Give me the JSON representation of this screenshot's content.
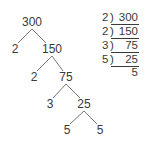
{
  "factor_tree": {
    "nodes": [
      {
        "id": "n300",
        "label": "300",
        "x": 32,
        "y": 22
      },
      {
        "id": "n2a",
        "label": "2",
        "x": 15,
        "y": 49
      },
      {
        "id": "n150",
        "label": "150",
        "x": 52,
        "y": 49
      },
      {
        "id": "n2b",
        "label": "2",
        "x": 34,
        "y": 77
      },
      {
        "id": "n75",
        "label": "75",
        "x": 66,
        "y": 77
      },
      {
        "id": "n3",
        "label": "3",
        "x": 50,
        "y": 104
      },
      {
        "id": "n25",
        "label": "25",
        "x": 84,
        "y": 104
      },
      {
        "id": "n5a",
        "label": "5",
        "x": 67,
        "y": 130
      },
      {
        "id": "n5b",
        "label": "5",
        "x": 100,
        "y": 130
      }
    ],
    "edges": [
      [
        "n300",
        "n2a"
      ],
      [
        "n300",
        "n150"
      ],
      [
        "n150",
        "n2b"
      ],
      [
        "n150",
        "n75"
      ],
      [
        "n75",
        "n3"
      ],
      [
        "n75",
        "n25"
      ],
      [
        "n25",
        "n5a"
      ],
      [
        "n25",
        "n5b"
      ]
    ]
  },
  "ladder_division": {
    "rows": [
      {
        "divisor": "2",
        "dividend": "300"
      },
      {
        "divisor": "2",
        "dividend": "150"
      },
      {
        "divisor": "3",
        "dividend": "75"
      },
      {
        "divisor": "5",
        "dividend": "25"
      }
    ],
    "quotient": "5"
  },
  "colors": {
    "ink": "#3a3a3a",
    "background": "#ffffff"
  }
}
